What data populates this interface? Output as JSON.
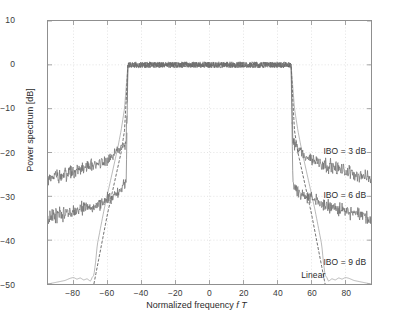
{
  "chart_data": {
    "type": "line",
    "title": "",
    "xlabel": "Normalized frequency f T",
    "xlabel_plain": "Normalized frequency",
    "xlabel_italic": "f T",
    "ylabel": "Power spectrum [dB]",
    "xlim": [
      -95,
      95
    ],
    "ylim": [
      -50,
      10
    ],
    "xticks": [
      -80,
      -60,
      -40,
      -20,
      0,
      20,
      40,
      60,
      80
    ],
    "xtick_labels": [
      "-80",
      "-60",
      "-40",
      "-20",
      "0",
      "20",
      "40",
      "60",
      "80"
    ],
    "yticks": [
      10,
      0,
      -10,
      -20,
      -30,
      -40,
      -50
    ],
    "ytick_labels": [
      "10",
      "0",
      "-10",
      "-20",
      "-30",
      "-40",
      "-50"
    ],
    "grid": true,
    "grid_style": "dotted",
    "legend_position": "in-plot annotations",
    "passband_edges": [
      -48,
      48
    ],
    "passband_level_db": 0,
    "series": [
      {
        "name": "IBO = 3 dB",
        "label": "IBO = 3 dB",
        "color": "#6e6e6e",
        "noisy": true,
        "noise_amplitude_db": 1.1,
        "description": "Largest spectral regrowth; sidelobes fall from about -17 dB just outside the passband to about -26 dB at the plot edge.",
        "points": [
          [
            -95,
            -26.0
          ],
          [
            -90,
            -25.4
          ],
          [
            -85,
            -24.8
          ],
          [
            -80,
            -24.3
          ],
          [
            -75,
            -23.6
          ],
          [
            -70,
            -23.0
          ],
          [
            -65,
            -22.3
          ],
          [
            -60,
            -21.5
          ],
          [
            -57,
            -20.9
          ],
          [
            -54,
            -20.0
          ],
          [
            -52,
            -19.2
          ],
          [
            -50,
            -18.1
          ],
          [
            -49,
            -17.2
          ],
          [
            -48,
            0
          ],
          [
            -40,
            0
          ],
          [
            -30,
            0
          ],
          [
            -20,
            0
          ],
          [
            -10,
            0
          ],
          [
            0,
            0
          ],
          [
            10,
            0
          ],
          [
            20,
            0
          ],
          [
            30,
            0
          ],
          [
            40,
            0
          ],
          [
            48,
            0
          ],
          [
            49,
            -17.2
          ],
          [
            50,
            -18.1
          ],
          [
            52,
            -19.2
          ],
          [
            54,
            -20.0
          ],
          [
            57,
            -20.9
          ],
          [
            60,
            -21.5
          ],
          [
            65,
            -22.3
          ],
          [
            70,
            -23.0
          ],
          [
            75,
            -23.6
          ],
          [
            80,
            -24.3
          ],
          [
            85,
            -24.8
          ],
          [
            90,
            -25.4
          ],
          [
            95,
            -26.0
          ]
        ]
      },
      {
        "name": "IBO = 6 dB",
        "label": "IBO = 6 dB",
        "color": "#6e6e6e",
        "noisy": true,
        "noise_amplitude_db": 1.1,
        "description": "Intermediate regrowth; sidelobes fall from about -27 dB just outside the passband to about -35 dB at the plot edge.",
        "points": [
          [
            -95,
            -35.0
          ],
          [
            -90,
            -34.5
          ],
          [
            -85,
            -34.0
          ],
          [
            -80,
            -33.5
          ],
          [
            -75,
            -32.9
          ],
          [
            -70,
            -32.3
          ],
          [
            -65,
            -31.6
          ],
          [
            -60,
            -30.8
          ],
          [
            -57,
            -30.2
          ],
          [
            -54,
            -29.4
          ],
          [
            -52,
            -28.6
          ],
          [
            -50,
            -27.6
          ],
          [
            -49,
            -26.8
          ],
          [
            -48,
            0
          ],
          [
            -40,
            0
          ],
          [
            -30,
            0
          ],
          [
            -20,
            0
          ],
          [
            -10,
            0
          ],
          [
            0,
            0
          ],
          [
            10,
            0
          ],
          [
            20,
            0
          ],
          [
            30,
            0
          ],
          [
            40,
            0
          ],
          [
            48,
            0
          ],
          [
            49,
            -26.8
          ],
          [
            50,
            -27.6
          ],
          [
            52,
            -28.6
          ],
          [
            54,
            -29.4
          ],
          [
            57,
            -30.2
          ],
          [
            60,
            -30.8
          ],
          [
            65,
            -31.6
          ],
          [
            70,
            -32.3
          ],
          [
            75,
            -32.9
          ],
          [
            80,
            -33.5
          ],
          [
            85,
            -34.0
          ],
          [
            90,
            -34.5
          ],
          [
            95,
            -35.0
          ]
        ]
      },
      {
        "name": "IBO = 9 dB",
        "label": "IBO = 9 dB",
        "color": "#4a4a4a",
        "noisy": false,
        "dashed": true,
        "description": "Steep skirt, nearly following the linear case; falls off the bottom of the axis near |fT| = 68.",
        "points": [
          [
            -68,
            -50
          ],
          [
            -66,
            -46
          ],
          [
            -64,
            -42
          ],
          [
            -62,
            -38
          ],
          [
            -60,
            -34
          ],
          [
            -58,
            -30.5
          ],
          [
            -56,
            -27
          ],
          [
            -54,
            -23.5
          ],
          [
            -52,
            -20
          ],
          [
            -50,
            -15
          ],
          [
            -49,
            -8
          ],
          [
            -48,
            0
          ],
          [
            48,
            0
          ],
          [
            49,
            -8
          ],
          [
            50,
            -15
          ],
          [
            52,
            -20
          ],
          [
            54,
            -23.5
          ],
          [
            56,
            -27
          ],
          [
            58,
            -30.5
          ],
          [
            60,
            -34
          ],
          [
            62,
            -38
          ],
          [
            64,
            -42
          ],
          [
            66,
            -46
          ],
          [
            68,
            -50
          ]
        ]
      },
      {
        "name": "Linear",
        "label": "Linear",
        "color": "#9a9a9a",
        "noisy": false,
        "description": "Reference spectrum without nonlinearity; essentially overlaps the IBO = 9 dB curve then decays along the axis floor with small ripples out to the plot edges.",
        "points": [
          [
            -95,
            -50
          ],
          [
            -90,
            -49.6
          ],
          [
            -85,
            -49.2
          ],
          [
            -82,
            -48.7
          ],
          [
            -80,
            -48.5
          ],
          [
            -78,
            -48.9
          ],
          [
            -76,
            -48.6
          ],
          [
            -74,
            -49.1
          ],
          [
            -72,
            -48.8
          ],
          [
            -70,
            -49.4
          ],
          [
            -69,
            -48.5
          ],
          [
            -68,
            -48.0
          ],
          [
            -67,
            -45
          ],
          [
            -66,
            -41
          ],
          [
            -64,
            -37
          ],
          [
            -62,
            -33
          ],
          [
            -60,
            -29.5
          ],
          [
            -58,
            -26
          ],
          [
            -56,
            -22.5
          ],
          [
            -54,
            -19
          ],
          [
            -52,
            -15
          ],
          [
            -50,
            -10
          ],
          [
            -49,
            -5
          ],
          [
            -48,
            0
          ],
          [
            48,
            0
          ],
          [
            49,
            -5
          ],
          [
            50,
            -10
          ],
          [
            52,
            -15
          ],
          [
            54,
            -19
          ],
          [
            56,
            -22.5
          ],
          [
            58,
            -26
          ],
          [
            60,
            -29.5
          ],
          [
            62,
            -33
          ],
          [
            64,
            -37
          ],
          [
            66,
            -41
          ],
          [
            67,
            -45
          ],
          [
            68,
            -48.0
          ],
          [
            69,
            -48.5
          ],
          [
            70,
            -49.4
          ],
          [
            72,
            -48.8
          ],
          [
            74,
            -49.1
          ],
          [
            76,
            -48.6
          ],
          [
            78,
            -48.9
          ],
          [
            80,
            -48.5
          ],
          [
            82,
            -48.7
          ],
          [
            85,
            -49.2
          ],
          [
            90,
            -49.6
          ],
          [
            95,
            -50
          ]
        ]
      }
    ],
    "annotations": [
      {
        "text": "IBO = 3 dB",
        "x": 66,
        "y": -19.5
      },
      {
        "text": "IBO = 6 dB",
        "x": 66,
        "y": -29.3
      },
      {
        "text": "IBO = 9 dB",
        "x": 66,
        "y": -44.5
      },
      {
        "text": "Linear",
        "x": 53,
        "y": -47.6
      }
    ]
  },
  "colors": {
    "axis": "#8f8f8f",
    "grid": "#dcdcdc",
    "text": "#2b2b2b",
    "tick_text": "#3a3a3a",
    "background": "#ffffff",
    "curve_noisy": "#6e6e6e",
    "curve_dashed": "#4a4a4a",
    "curve_linear": "#9a9a9a"
  }
}
